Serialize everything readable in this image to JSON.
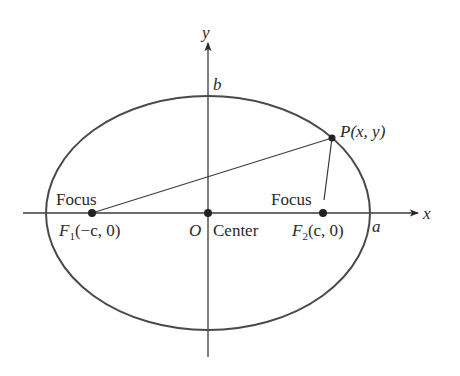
{
  "diagram": {
    "type": "ellipse-foci",
    "colors": {
      "stroke": "#3a3a3a",
      "text": "#2a2a2a",
      "background": "#ffffff"
    },
    "axes": {
      "x_label": "x",
      "y_label": "y"
    },
    "ellipse": {
      "cx": 208,
      "cy": 213,
      "rx": 162,
      "ry": 117
    },
    "labels": {
      "b": "b",
      "a": "a",
      "origin": "O",
      "center": "Center",
      "focus_left": "Focus",
      "focus_right": "Focus",
      "f1_letter": "F",
      "f1_sub": "1",
      "f1_coords": "(−c, 0)",
      "f2_letter": "F",
      "f2_sub": "2",
      "f2_coords": "(c, 0)",
      "point": "P(x, y)"
    },
    "points": {
      "F1": {
        "x": 92,
        "y": 213
      },
      "F2": {
        "x": 323,
        "y": 213
      },
      "O": {
        "x": 208,
        "y": 213
      },
      "P": {
        "x": 332,
        "y": 138
      }
    }
  }
}
